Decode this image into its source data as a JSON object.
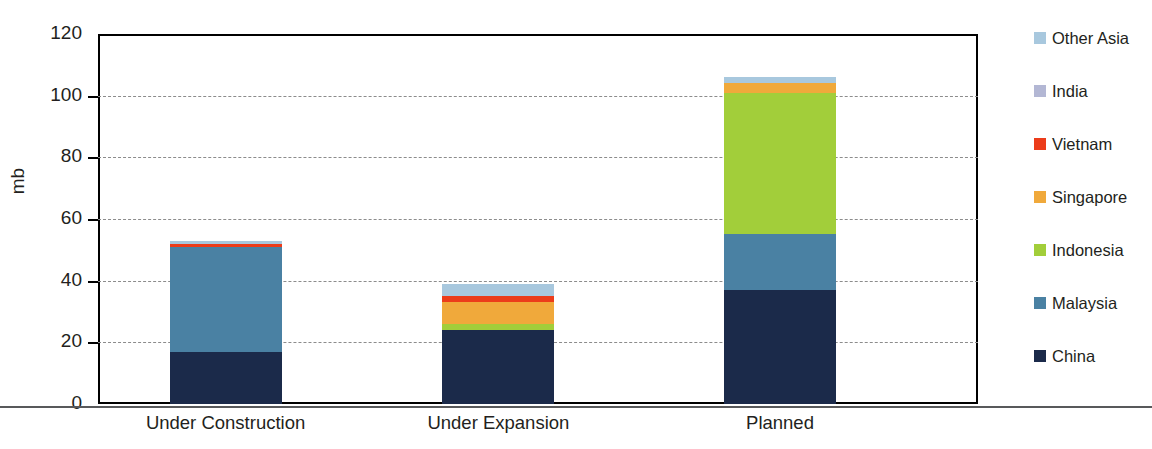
{
  "chart_data": {
    "type": "bar",
    "subtype": "stacked-bar",
    "title": "",
    "subtitle": "",
    "xlabel": "",
    "ylabel": "mb",
    "ylim": [
      0,
      120
    ],
    "ytick_step": 20,
    "yticks": [
      0,
      20,
      40,
      60,
      80,
      100,
      120
    ],
    "ytick_labels": [
      "0",
      "20",
      "40",
      "60",
      "80",
      "100",
      "120"
    ],
    "grid": true,
    "grid_axis": "y",
    "grid_style": "dashed",
    "legend_position": "right",
    "legend_order": "top-to-bottom",
    "stack_order_bottom_to_top": [
      "China",
      "Malaysia",
      "Indonesia",
      "Singapore",
      "Vietnam",
      "India",
      "Other Asia"
    ],
    "categories": [
      "Under Construction",
      "Under Expansion",
      "Planned"
    ],
    "series": [
      {
        "name": "China",
        "color": "#1b2a4a",
        "values": [
          17,
          24,
          37
        ]
      },
      {
        "name": "Malaysia",
        "color": "#4a81a3",
        "values": [
          34,
          0,
          18
        ]
      },
      {
        "name": "Indonesia",
        "color": "#a2ce3a",
        "values": [
          0,
          2,
          46
        ]
      },
      {
        "name": "Singapore",
        "color": "#f0a93b",
        "values": [
          0,
          7,
          3
        ]
      },
      {
        "name": "Vietnam",
        "color": "#ec3c1a",
        "values": [
          1,
          2,
          0
        ]
      },
      {
        "name": "India",
        "color": "#b3b7d4",
        "values": [
          0,
          0,
          0
        ]
      },
      {
        "name": "Other Asia",
        "color": "#a8c8de",
        "values": [
          1,
          4,
          2
        ]
      }
    ],
    "totals": [
      53,
      39,
      106
    ]
  },
  "legend": {
    "items": [
      {
        "label": "Other Asia",
        "color": "#a8c8de"
      },
      {
        "label": "India",
        "color": "#b3b7d4"
      },
      {
        "label": "Vietnam",
        "color": "#ec3c1a"
      },
      {
        "label": "Singapore",
        "color": "#f0a93b"
      },
      {
        "label": "Indonesia",
        "color": "#a2ce3a"
      },
      {
        "label": "Malaysia",
        "color": "#4a81a3"
      },
      {
        "label": "China",
        "color": "#1b2a4a"
      }
    ]
  },
  "axis": {
    "y_title": "mb",
    "y_labels": [
      "120",
      "100",
      "80",
      "60",
      "40",
      "20",
      "0"
    ],
    "x_labels": [
      "Under Construction",
      "Under Expansion",
      "Planned"
    ]
  },
  "colors": {
    "axis_line": "#000000",
    "gridline": "#8c8c8c",
    "text": "#231f20",
    "background": "#ffffff"
  }
}
